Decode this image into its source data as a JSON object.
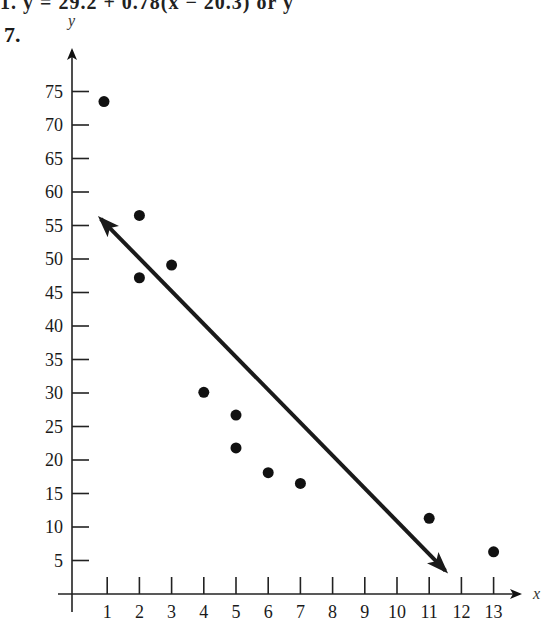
{
  "header": {
    "cut_line": "1. y = 29.2 + 0.78(x − 20.3)   or   y",
    "problem_number": "7."
  },
  "chart_data": {
    "type": "scatter",
    "title": "",
    "xlabel": "x",
    "ylabel": "y",
    "x_ticks": [
      1,
      2,
      3,
      4,
      5,
      6,
      7,
      8,
      9,
      10,
      11,
      12,
      13
    ],
    "y_ticks": [
      5,
      10,
      15,
      20,
      25,
      30,
      35,
      40,
      45,
      50,
      55,
      60,
      65,
      70,
      75
    ],
    "xlim": [
      0,
      14
    ],
    "ylim": [
      0,
      80
    ],
    "grid": false,
    "legend": null,
    "points": [
      {
        "x": 0.9,
        "y": 73.5
      },
      {
        "x": 2,
        "y": 56.5
      },
      {
        "x": 2,
        "y": 47.2
      },
      {
        "x": 3,
        "y": 49.1
      },
      {
        "x": 4,
        "y": 30.1
      },
      {
        "x": 5,
        "y": 26.7
      },
      {
        "x": 5,
        "y": 21.8
      },
      {
        "x": 6,
        "y": 18.1
      },
      {
        "x": 7,
        "y": 16.5
      },
      {
        "x": 11,
        "y": 11.3
      },
      {
        "x": 13,
        "y": 6.3
      }
    ],
    "regression_line": {
      "description": "double-headed arrow line of best fit",
      "start": {
        "x": 0.8,
        "y": 56
      },
      "end": {
        "x": 11.5,
        "y": 3.5
      }
    }
  }
}
